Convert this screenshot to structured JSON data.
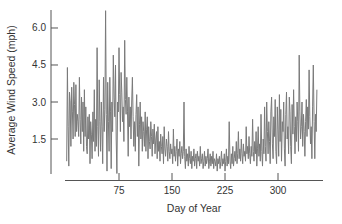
{
  "chart_data": {
    "type": "line",
    "title": "",
    "xlabel": "Day of Year",
    "ylabel": "Average Wind Speed (mph)",
    "xlim": [
      0,
      365
    ],
    "ylim": [
      0,
      6.8
    ],
    "xticks": [
      75,
      150,
      225,
      300
    ],
    "yticks": [
      1.5,
      3.0,
      4.5,
      6.0
    ],
    "xtick_labels": [
      "75",
      "150",
      "225",
      "300"
    ],
    "ytick_labels": [
      "1.5",
      "3.0",
      "4.5",
      "6.0"
    ],
    "grid": false,
    "legend": null,
    "line_color": "#7a7a7a",
    "series": [
      {
        "name": "Average Wind Speed",
        "x_step": 1,
        "x_start": 1,
        "values_note": "daily averages, approximated from plot",
        "values": [
          0.6,
          4.4,
          2.0,
          0.4,
          3.4,
          3.0,
          1.2,
          3.6,
          2.6,
          1.5,
          3.8,
          2.9,
          1.6,
          3.7,
          1.8,
          2.5,
          2.2,
          1.6,
          4.0,
          2.3,
          1.3,
          3.2,
          1.8,
          3.0,
          1.0,
          3.5,
          1.6,
          2.8,
          1.2,
          0.9,
          2.4,
          1.5,
          2.5,
          0.5,
          2.2,
          1.7,
          0.7,
          2.6,
          1.4,
          3.5,
          1.0,
          2.3,
          1.2,
          5.2,
          2.0,
          0.8,
          3.9,
          2.2,
          1.0,
          3.0,
          2.0,
          0.5,
          4.0,
          1.8,
          2.7,
          6.7,
          2.5,
          0.2,
          3.8,
          2.2,
          1.0,
          4.0,
          2.6,
          0.3,
          3.0,
          1.8,
          4.9,
          3.2,
          2.4,
          4.5,
          1.5,
          0.1,
          3.0,
          2.6,
          5.2,
          3.3,
          1.8,
          4.2,
          3.4,
          2.2,
          2.8,
          1.4,
          5.5,
          3.1,
          2.5,
          4.0,
          2.6,
          0.8,
          3.2,
          2.0,
          2.8,
          1.5,
          3.0,
          4.0,
          2.4,
          1.2,
          2.2,
          1.0,
          2.5,
          3.3,
          1.6,
          2.8,
          0.4,
          2.1,
          3.0,
          1.5,
          2.4,
          1.0,
          2.2,
          1.8,
          1.2,
          2.6,
          1.0,
          1.9,
          2.4,
          0.7,
          2.0,
          1.4,
          1.1,
          2.2,
          1.6,
          0.8,
          1.9,
          1.3,
          2.1,
          0.9,
          1.5,
          1.8,
          0.7,
          2.0,
          1.0,
          1.4,
          0.6,
          1.7,
          1.2,
          0.9,
          1.6,
          0.5,
          2.0,
          1.1,
          0.8,
          1.5,
          1.2,
          0.6,
          1.8,
          1.0,
          0.7,
          1.3,
          0.9,
          1.1,
          0.5,
          1.9,
          0.8,
          1.2,
          0.6,
          1.0,
          1.5,
          0.4,
          1.1,
          0.8,
          1.4,
          0.5,
          0.9,
          1.2,
          0.7,
          1.0,
          3.0,
          0.8,
          0.3,
          1.1,
          0.6,
          0.9,
          0.4,
          1.2,
          0.7,
          0.5,
          1.0,
          0.3,
          0.8,
          0.6,
          1.1,
          0.4,
          0.7,
          0.9,
          0.3,
          1.0,
          0.6,
          0.8,
          0.4,
          1.2,
          0.5,
          0.7,
          0.9,
          0.3,
          0.6,
          1.0,
          0.4,
          0.8,
          0.5,
          0.7,
          1.1,
          0.3,
          0.6,
          0.9,
          0.4,
          0.8,
          0.5,
          1.0,
          0.3,
          0.7,
          0.6,
          0.4,
          0.9,
          0.2,
          0.7,
          0.5,
          0.8,
          0.3,
          0.6,
          1.0,
          0.4,
          0.7,
          0.5,
          0.9,
          0.2,
          0.6,
          1.1,
          0.4,
          0.8,
          0.5,
          2.2,
          0.6,
          0.3,
          0.9,
          0.5,
          1.2,
          0.4,
          0.7,
          1.0,
          0.6,
          1.4,
          0.5,
          0.9,
          1.8,
          0.7,
          1.1,
          0.6,
          1.5,
          0.9,
          0.5,
          1.3,
          0.8,
          1.0,
          0.6,
          2.0,
          0.9,
          1.2,
          0.7,
          1.6,
          0.9,
          0.5,
          1.2,
          0.8,
          2.3,
          1.0,
          0.6,
          1.4,
          0.9,
          1.8,
          0.4,
          1.1,
          2.0,
          0.8,
          1.3,
          0.6,
          2.5,
          1.0,
          0.4,
          1.5,
          0.9,
          2.8,
          1.2,
          0.6,
          3.0,
          1.8,
          0.9,
          2.2,
          1.4,
          0.5,
          2.6,
          3.2,
          1.3,
          0.7,
          2.4,
          1.6,
          3.1,
          1.0,
          0.5,
          2.8,
          1.9,
          0.8,
          3.3,
          1.4,
          2.7,
          0.6,
          2.2,
          1.8,
          3.0,
          1.1,
          0.4,
          2.5,
          3.4,
          1.5,
          2.0,
          0.9,
          3.2,
          2.6,
          1.2,
          0.5,
          2.9,
          1.7,
          3.5,
          2.0,
          0.9,
          2.4,
          1.4,
          3.0,
          2.2,
          1.0,
          4.9,
          2.6,
          1.5,
          2.0,
          3.0,
          1.2,
          2.5,
          1.8,
          0.8,
          2.2,
          3.1,
          1.6,
          2.8,
          1.9,
          4.3,
          2.4,
          1.3,
          2.0,
          0.7,
          2.8,
          4.5,
          2.2,
          0.7,
          2.5,
          1.8,
          3.5
        ]
      }
    ]
  }
}
